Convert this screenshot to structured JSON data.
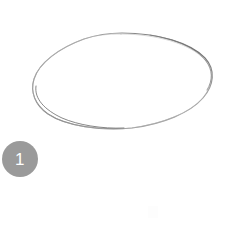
{
  "canvas": {
    "width": 242,
    "height": 229,
    "background_color": "#ffffff",
    "alt": "Hand-drawn pencil ellipse sketch tutorial step"
  },
  "step_badge": {
    "number": "1",
    "background_color": "#9a9a9a",
    "text_color": "#ffffff",
    "diameter_px": 36,
    "position": {
      "x": 2,
      "y": 141
    }
  },
  "drawing": {
    "type": "ellipse-outline",
    "label": "hand-drawn-ellipse",
    "stroke_color": "#8d8d8d",
    "stroke_width": 1,
    "fill": "none",
    "center": {
      "x": 124,
      "y": 81
    },
    "radius_x": 88,
    "radius_y": 48,
    "rotation_deg": -4,
    "bounds": {
      "left": 36,
      "top": 33,
      "right": 212,
      "bottom": 129
    }
  },
  "artifacts": [
    {
      "name": "faint-smudge",
      "color": "#fdfdfd",
      "position": {
        "x": 148,
        "y": 206
      }
    }
  ]
}
